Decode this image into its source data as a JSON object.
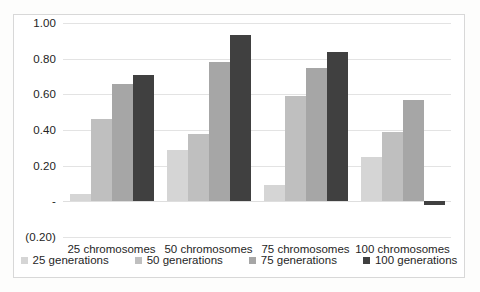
{
  "chart_data": {
    "type": "bar",
    "title": "",
    "subtitle": "",
    "xlabel": "",
    "ylabel": "",
    "categories": [
      "25 chromosomes",
      "50 chromosomes",
      "75 chromosomes",
      "100 chromosomes"
    ],
    "series": [
      {
        "name": "25 generations",
        "color": "#d5d5d5",
        "values": [
          0.04,
          0.29,
          0.09,
          0.25
        ]
      },
      {
        "name": "50 generations",
        "color": "#bfbfbf",
        "values": [
          0.46,
          0.38,
          0.59,
          0.39
        ]
      },
      {
        "name": "75 generations",
        "color": "#a6a6a6",
        "values": [
          0.66,
          0.78,
          0.75,
          0.57
        ]
      },
      {
        "name": "100 generations",
        "color": "#404040",
        "values": [
          0.71,
          0.93,
          0.84,
          -0.02
        ]
      }
    ],
    "ylim": [
      -0.2,
      1.0
    ],
    "ytick_values": [
      1.0,
      0.8,
      0.6,
      0.4,
      0.2,
      0.0,
      -0.2
    ],
    "ytick_labels": [
      "1.00",
      "0.80",
      "0.60",
      "0.40",
      "0.20",
      "-",
      "(0.20)"
    ],
    "grid": true,
    "legend_position": "bottom",
    "annotations": []
  },
  "frame": {
    "border_color": "#d8d8d8",
    "background": "#ffffff"
  }
}
